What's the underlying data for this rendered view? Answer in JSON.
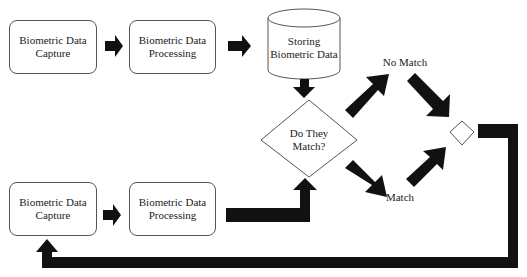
{
  "diagram": {
    "top_row": {
      "capture": {
        "line1": "Biometric Data",
        "line2": "Capture"
      },
      "processing": {
        "line1": "Biometric Data",
        "line2": "Processing"
      },
      "storage": {
        "line1": "Storing",
        "line2": "Biometric Data"
      }
    },
    "bottom_row": {
      "capture": {
        "line1": "Biometric Data",
        "line2": "Capture"
      },
      "processing": {
        "line1": "Biometric Data",
        "line2": "Processing"
      }
    },
    "decision": {
      "line1": "Do They",
      "line2": "Match?"
    },
    "branches": {
      "no_match": "No Match",
      "match": "Match"
    },
    "colors": {
      "arrow": "#111111",
      "border": "#555555"
    }
  }
}
